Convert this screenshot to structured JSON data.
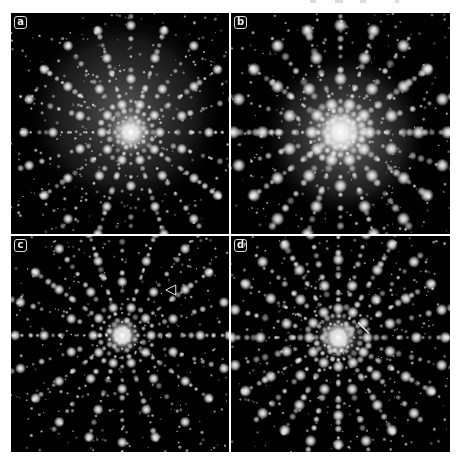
{
  "figure": {
    "background_color": "#000000",
    "spot_color": "#ffffff",
    "panels": [
      {
        "id": "a",
        "label": "a",
        "symmetry": 10,
        "center": [
          0.55,
          0.54
        ],
        "halo_radius": 0.36,
        "halo_center": [
          0.52,
          0.45
        ],
        "halo_strength": 0.45,
        "central_spot": 14,
        "spot_scale": 1.0,
        "seed": 11
      },
      {
        "id": "b",
        "label": "b",
        "symmetry": 10,
        "center": [
          0.5,
          0.54
        ],
        "halo_radius": 0.3,
        "halo_center": [
          0.52,
          0.55
        ],
        "halo_strength": 0.55,
        "central_spot": 20,
        "spot_scale": 1.25,
        "seed": 23
      },
      {
        "id": "c",
        "label": "c",
        "symmetry": 10,
        "center": [
          0.51,
          0.46
        ],
        "halo_radius": 0.0,
        "halo_center": [
          0.51,
          0.46
        ],
        "halo_strength": 0.0,
        "central_spot": 12,
        "spot_scale": 1.0,
        "seed": 37,
        "annotation": {
          "type": "arrowhead",
          "x": 0.71,
          "y": 0.25,
          "direction": "left"
        }
      },
      {
        "id": "d",
        "label": "d",
        "symmetry": 12,
        "center": [
          0.49,
          0.47
        ],
        "halo_radius": 0.0,
        "halo_center": [
          0.49,
          0.47
        ],
        "halo_strength": 0.0,
        "central_spot": 14,
        "spot_scale": 1.1,
        "seed": 53,
        "annotation": {
          "type": "line",
          "x1": 0.58,
          "y1": 0.4,
          "x2": 0.63,
          "y2": 0.45
        }
      }
    ]
  }
}
